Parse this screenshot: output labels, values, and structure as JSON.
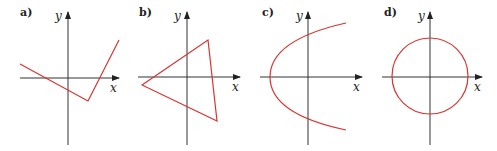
{
  "panels": [
    {
      "label": "a)",
      "x_axis_label": "x",
      "y_axis_label": "y",
      "shape": "v-shaped polyline"
    },
    {
      "label": "b)",
      "x_axis_label": "x",
      "y_axis_label": "y",
      "shape": "triangle"
    },
    {
      "label": "c)",
      "x_axis_label": "x",
      "y_axis_label": "y",
      "shape": "sideways parabola"
    },
    {
      "label": "d)",
      "x_axis_label": "x",
      "y_axis_label": "y",
      "shape": "circle"
    }
  ],
  "colors": {
    "curve": "#d9332f",
    "axis": "#333333"
  }
}
